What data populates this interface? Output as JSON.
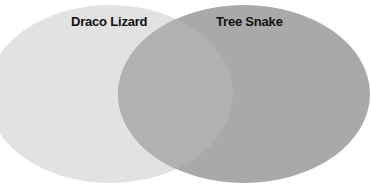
{
  "diagram": {
    "type": "venn",
    "sets": [
      {
        "label": "Draco Lizard",
        "color": "#e2e2e2"
      },
      {
        "label": "Tree Snake",
        "color": "#a9a9a9"
      }
    ],
    "intersection": {
      "label": "",
      "color": "#b1b1b1"
    }
  }
}
